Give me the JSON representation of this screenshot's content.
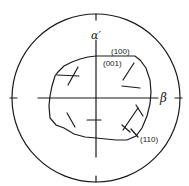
{
  "diagram": {
    "type": "stereographic-projection",
    "axes": {
      "vertical_label": "α′",
      "horizontal_label": "β"
    },
    "labels": {
      "plane_100": "(100)",
      "plane_001": "(001)",
      "plane_110": "(110)"
    },
    "colors": {
      "stroke": "#1a1a1a",
      "background": "#ffffff"
    }
  }
}
